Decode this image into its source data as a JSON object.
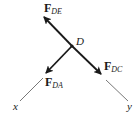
{
  "diagram": {
    "type": "free-body-diagram",
    "joint": {
      "label": "D"
    },
    "forces": [
      {
        "id": "fde",
        "main": "F",
        "sub": "DE"
      },
      {
        "id": "fda",
        "main": "F",
        "sub": "DA"
      },
      {
        "id": "fdc",
        "main": "F",
        "sub": "DC"
      }
    ],
    "axes": [
      {
        "id": "x",
        "label": "x"
      },
      {
        "id": "y",
        "label": "y"
      }
    ],
    "colors": {
      "force_arrow": "#1a1a1a",
      "axis_line": "#555555",
      "text": "#1a1a1a"
    }
  }
}
